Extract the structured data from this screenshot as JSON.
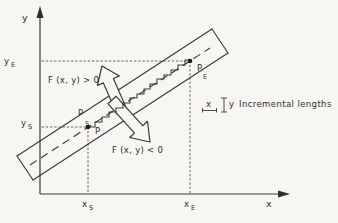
{
  "figure": {
    "type": "line-rasterization-diagram",
    "description_visible_text_only": true
  },
  "colors": {
    "paper": "#f7f6f2",
    "ink": "#3a3a3a",
    "text": "#2e2e2e"
  },
  "axes": {
    "y_label": "y",
    "x_label": "x"
  },
  "ticks": {
    "y_e": {
      "base": "y",
      "sub": "E"
    },
    "y_s": {
      "base": "y",
      "sub": "S"
    },
    "x_s": {
      "base": "x",
      "sub": "S"
    },
    "x_e": {
      "base": "x",
      "sub": "E"
    }
  },
  "points": {
    "start": {
      "base": "P",
      "sub": "S"
    },
    "start_pixel": "P",
    "end": {
      "base": "P",
      "sub": "E"
    }
  },
  "regions": {
    "above_line": "F (x, y) > 0",
    "below_line": "F (x, y) < 0"
  },
  "legend": {
    "dx_symbol": "x",
    "dy_symbol": "y",
    "label": "Incremental lengths"
  }
}
